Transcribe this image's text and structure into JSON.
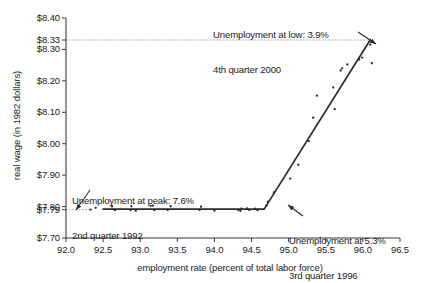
{
  "chart_data": {
    "type": "scatter",
    "title": "",
    "xlabel": "employment rate (percent of total labor force)",
    "ylabel": "real wage (in 1982 dollars)",
    "xlim": [
      92.0,
      96.5
    ],
    "ylim": [
      7.7,
      8.4
    ],
    "grid": false,
    "legend": "none",
    "xticks": [
      "92.0",
      "92.5",
      "93.0",
      "93.5",
      "94.0",
      "94.5",
      "95.0",
      "95.5",
      "96.0",
      "96.5"
    ],
    "xtick_values": [
      92.0,
      92.5,
      93.0,
      93.5,
      94.0,
      94.5,
      95.0,
      95.5,
      96.0,
      96.5
    ],
    "yticks": [
      "$8.40",
      "$8.33",
      "$8.30",
      "$8.20",
      "$8.10",
      "$8.00",
      "$7.90",
      "$7.80",
      "$7.79",
      "$7.70"
    ],
    "ytick_values": [
      8.4,
      8.33,
      8.3,
      8.2,
      8.1,
      8.0,
      7.9,
      7.8,
      7.79,
      7.7
    ],
    "points": [
      [
        92.33,
        7.7905
      ],
      [
        92.4,
        7.796
      ],
      [
        92.62,
        7.801
      ],
      [
        92.66,
        7.7885
      ],
      [
        92.88,
        7.801
      ],
      [
        92.87,
        7.789
      ],
      [
        92.94,
        7.7865
      ],
      [
        93.14,
        7.8025
      ],
      [
        93.17,
        7.803
      ],
      [
        93.19,
        7.789
      ],
      [
        93.37,
        7.789
      ],
      [
        93.41,
        7.801
      ],
      [
        93.82,
        7.7995
      ],
      [
        93.8,
        7.789
      ],
      [
        94.0,
        7.787
      ],
      [
        94.32,
        7.789
      ],
      [
        94.35,
        7.786
      ],
      [
        94.36,
        7.7935
      ],
      [
        94.44,
        7.7945
      ],
      [
        94.47,
        7.789
      ],
      [
        94.55,
        7.793
      ],
      [
        94.58,
        7.788
      ],
      [
        94.7,
        7.803
      ],
      [
        94.72,
        7.816
      ],
      [
        94.8,
        7.845
      ],
      [
        95.02,
        7.889
      ],
      [
        95.13,
        7.933
      ],
      [
        95.27,
        8.008
      ],
      [
        95.33,
        8.083
      ],
      [
        95.38,
        8.153
      ],
      [
        95.62,
        8.11
      ],
      [
        95.6,
        8.179
      ],
      [
        95.7,
        8.233
      ],
      [
        95.72,
        8.24
      ],
      [
        95.79,
        8.252
      ],
      [
        95.95,
        8.268
      ],
      [
        95.99,
        8.274
      ],
      [
        96.1,
        8.315
      ],
      [
        96.12,
        8.256
      ]
    ],
    "trend_segments": [
      {
        "name": "flat-wage-segment",
        "x0": 92.5,
        "y0": 7.792,
        "x1": 94.67,
        "y1": 7.792
      },
      {
        "name": "rising-wage-segment",
        "x0": 94.67,
        "y0": 7.792,
        "x1": 96.1,
        "y1": 8.331
      }
    ],
    "reference_lines": [
      {
        "name": "high-wage-reference",
        "value": 8.33,
        "from_x": 92.0,
        "to_x": 96.1
      },
      {
        "name": "low-wage-reference",
        "value": 7.79,
        "from_x": 92.0,
        "to_x": 92.36
      }
    ],
    "annotations": [
      {
        "name": "low-unemployment-annotation",
        "line1": "Unemployment at low: 3.9%",
        "line2": "4th quarter 2000",
        "points_to": [
          96.1,
          8.331
        ]
      },
      {
        "name": "peak-unemployment-annotation",
        "line1": "Unemployment at peak: 7.6%",
        "line2": "2nd quarter 1992",
        "points_to": [
          92.36,
          7.7905
        ]
      },
      {
        "name": "mid-unemployment-annotation",
        "line1": "Unemployment at 5.3%",
        "line2": "3rd quarter 1996",
        "points_to": [
          94.67,
          7.792
        ]
      }
    ],
    "colors": {
      "axis": "#3b3b3b",
      "point": "#2b2b2b",
      "trend": "#2b2b2b",
      "reference": "#8a8a8a",
      "text": "#1a1a1a",
      "background": "#ffffff"
    }
  }
}
